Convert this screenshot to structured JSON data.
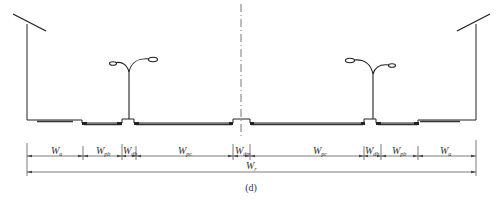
{
  "figure": {
    "caption": "(d)",
    "colors": {
      "line": "#222222",
      "pavement": "#333333",
      "dim": "#444444",
      "centerline": "#555555"
    }
  },
  "segments": [
    {
      "id": "wa-left",
      "main": "W",
      "sub": "a",
      "x0": 27,
      "x1": 83
    },
    {
      "id": "wpb-left",
      "main": "W",
      "sub": "pb",
      "x0": 83,
      "x1": 122
    },
    {
      "id": "wdb-left",
      "main": "W",
      "sub": "db",
      "x0": 122,
      "x1": 136
    },
    {
      "id": "wpc-left",
      "main": "W",
      "sub": "pc",
      "x0": 136,
      "x1": 233
    },
    {
      "id": "wdm",
      "main": "W",
      "sub": "dm",
      "x0": 233,
      "x1": 250
    },
    {
      "id": "wpc-right",
      "main": "W",
      "sub": "pc",
      "x0": 250,
      "x1": 364
    },
    {
      "id": "wdb-right",
      "main": "W",
      "sub": "db",
      "x0": 364,
      "x1": 381
    },
    {
      "id": "wpb-right",
      "main": "W",
      "sub": "pb",
      "x0": 381,
      "x1": 418
    },
    {
      "id": "wa-right",
      "main": "W",
      "sub": "a",
      "x0": 418,
      "x1": 476
    }
  ],
  "total": {
    "main": "W",
    "sub": "r",
    "x0": 27,
    "x1": 476
  },
  "labels": {
    "wa_left": {
      "main": "W",
      "sub": "a"
    },
    "wpb_left": {
      "main": "W",
      "sub": "pb"
    },
    "wdb_left": {
      "main": "W",
      "sub": "db"
    },
    "wpc_left": {
      "main": "W",
      "sub": "pc"
    },
    "wdm": {
      "main": "W",
      "sub": "dm"
    },
    "wpc_right": {
      "main": "W",
      "sub": "pc"
    },
    "wdb_right": {
      "main": "W",
      "sub": "db"
    },
    "wpb_right": {
      "main": "W",
      "sub": "pb"
    },
    "wa_right": {
      "main": "W",
      "sub": "a"
    },
    "wr": {
      "main": "W",
      "sub": "r"
    }
  }
}
